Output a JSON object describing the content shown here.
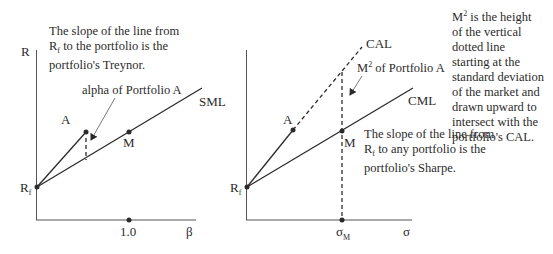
{
  "left_panel": {
    "y_axis_label": "R",
    "x_axis_label": "β",
    "x_tick_label": "1.0",
    "rf_label": "R",
    "rf_sub": "f",
    "point_a_label": "A",
    "point_m_label": "M",
    "line_label": "SML",
    "alpha_annotation": "alpha of Portfolio A",
    "note_line1_rest": " to the portfolio is the",
    "note_line0": "The slope of the line from",
    "note_r": "R",
    "note_sub": "f",
    "note_line2": "portfolio's Treynor."
  },
  "right_panel": {
    "x_axis_label": "σ",
    "x_tick_label": "σ",
    "x_tick_sub": "M",
    "rf_label": "R",
    "rf_sub": "f",
    "point_a_label": "A",
    "point_m_label": "M",
    "cal_label": "CAL",
    "cml_label": "CML",
    "m2_annotation_m": "M",
    "m2_annotation_sup": "2",
    "m2_annotation_rest": " of Portfolio A",
    "sharpe_line0": "The slope of the line from",
    "sharpe_r": "R",
    "sharpe_sub": "f",
    "sharpe_line1_rest": " to any portfolio is the",
    "sharpe_line2": "portfolio's Sharpe."
  },
  "side_note": {
    "m": "M",
    "sup": "2",
    "first_rest": " is the height",
    "lines": [
      "of the vertical",
      "dotted line",
      "starting at the",
      "standard deviation",
      "of the market and",
      "drawn upward to",
      "intersect with the",
      "portfolio's CAL."
    ]
  },
  "colors": {
    "ink": "#2b2b2b",
    "background": "#ffffff"
  }
}
